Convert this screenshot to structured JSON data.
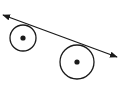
{
  "diagram": {
    "type": "geometry",
    "stroke_color": "#1a1a1a",
    "background": "#ffffff",
    "line": {
      "x1": 3,
      "y1": 15,
      "x2": 117,
      "y2": 57,
      "arrows": "both"
    },
    "circles": [
      {
        "name": "small",
        "cx": 23,
        "cy": 38,
        "r": 13
      },
      {
        "name": "large",
        "cx": 77,
        "cy": 62,
        "r": 17
      }
    ]
  }
}
